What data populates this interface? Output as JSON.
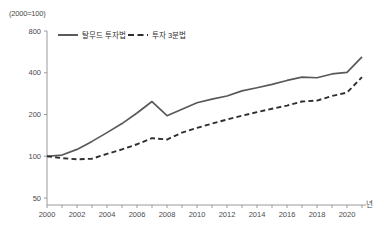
{
  "chart_data": {
    "type": "line",
    "title": "",
    "subtitle": "",
    "y_unit_label": "(2000=100)",
    "x_unit_label": "년",
    "xlabel": "",
    "ylabel": "",
    "yscale": "log",
    "ylim": [
      50,
      800
    ],
    "yticks": [
      50,
      100,
      200,
      400,
      800
    ],
    "ytick_labels": [
      "50",
      "100",
      "200",
      "400",
      "800"
    ],
    "xlim": [
      2000,
      2021
    ],
    "xticks": [
      2000,
      2001,
      2002,
      2003,
      2004,
      2005,
      2006,
      2007,
      2008,
      2009,
      2010,
      2011,
      2012,
      2013,
      2014,
      2015,
      2016,
      2017,
      2018,
      2019,
      2020,
      2021
    ],
    "xtick_labels": [
      "2000",
      "",
      "2002",
      "",
      "2004",
      "",
      "2006",
      "",
      "2008",
      "",
      "2010",
      "",
      "2012",
      "",
      "2014",
      "",
      "2016",
      "",
      "2018",
      "",
      "2020",
      ""
    ],
    "grid": false,
    "legend_position": "top-center",
    "x": [
      2000,
      2001,
      2002,
      2003,
      2004,
      2005,
      2006,
      2007,
      2008,
      2009,
      2010,
      2011,
      2012,
      2013,
      2014,
      2015,
      2016,
      2017,
      2018,
      2019,
      2020,
      2021
    ],
    "series": [
      {
        "name": "탈무드 투자법",
        "style": "solid",
        "color": "#595959",
        "values": [
          100,
          102,
          112,
          128,
          148,
          172,
          205,
          248,
          196,
          218,
          243,
          258,
          272,
          296,
          312,
          330,
          352,
          372,
          368,
          392,
          402,
          520
        ]
      },
      {
        "name": "투자 3분법",
        "style": "dashed",
        "color": "#2e2e2e",
        "values": [
          100,
          97,
          95,
          96,
          104,
          112,
          122,
          135,
          132,
          148,
          160,
          172,
          184,
          196,
          208,
          220,
          232,
          248,
          252,
          272,
          288,
          372
        ]
      }
    ]
  },
  "legend": {
    "items": [
      {
        "label": "탈무드 투자법"
      },
      {
        "label": "투자 3분법"
      }
    ]
  }
}
